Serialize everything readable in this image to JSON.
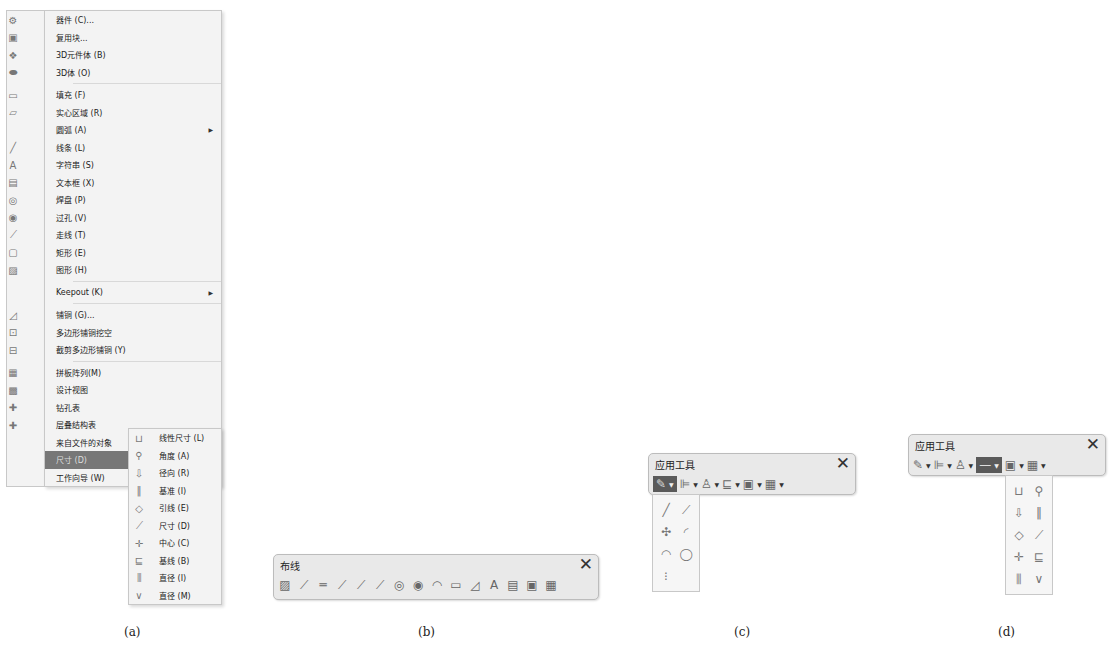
{
  "panel_a": {
    "main_menu": [
      {
        "icon": "component-icon",
        "glyph": "⚙",
        "label": "器件 (C)...",
        "submenu": false
      },
      {
        "icon": "reuse-block-icon",
        "glyph": "▣",
        "label": "复用块...",
        "submenu": false
      },
      {
        "icon": "3d-body-icon",
        "glyph": "❖",
        "label": "3D元件体 (B)",
        "submenu": false
      },
      {
        "icon": "3d-solid-icon",
        "glyph": "⬬",
        "label": "3D体 (O)",
        "submenu": false,
        "sep_after": true
      },
      {
        "icon": "fill-icon",
        "glyph": "▭",
        "label": "填充 (F)",
        "submenu": false
      },
      {
        "icon": "solid-region-icon",
        "glyph": "▱",
        "label": "实心区域 (R)",
        "submenu": false
      },
      {
        "icon": "",
        "glyph": "",
        "label": "圆弧 (A)",
        "submenu": true
      },
      {
        "icon": "line-icon",
        "glyph": "╱",
        "label": "线条 (L)",
        "submenu": false
      },
      {
        "icon": "string-icon",
        "glyph": "A",
        "label": "字符串 (S)",
        "submenu": false
      },
      {
        "icon": "text-frame-icon",
        "glyph": "▤",
        "label": "文本框 (X)",
        "submenu": false
      },
      {
        "icon": "pad-icon",
        "glyph": "◎",
        "label": "焊盘 (P)",
        "submenu": false
      },
      {
        "icon": "via-icon",
        "glyph": "◉",
        "label": "过孔 (V)",
        "submenu": false
      },
      {
        "icon": "track-icon",
        "glyph": "⟋",
        "label": "走线 (T)",
        "submenu": false
      },
      {
        "icon": "rectangle-icon",
        "glyph": "▢",
        "label": "矩形 (E)",
        "submenu": false
      },
      {
        "icon": "graphic-icon",
        "glyph": "▨",
        "label": "图形 (H)",
        "submenu": false,
        "sep_after": true
      },
      {
        "icon": "",
        "glyph": "",
        "label": "Keepout (K)",
        "submenu": true,
        "sep_after": true
      },
      {
        "icon": "polygon-pour-icon",
        "glyph": "◿",
        "label": "铺铜 (G)...",
        "submenu": false
      },
      {
        "icon": "polygon-cutout-icon",
        "glyph": "⊡",
        "label": "多边形铺铜挖空",
        "submenu": false
      },
      {
        "icon": "slice-polygon-icon",
        "glyph": "⊟",
        "label": "截剪多边形铺铜 (Y)",
        "submenu": false,
        "sep_after": true
      },
      {
        "icon": "panel-array-icon",
        "glyph": "▦",
        "label": "拼板阵列(M)",
        "submenu": false
      },
      {
        "icon": "design-view-icon",
        "glyph": "▩",
        "label": "设计视图",
        "submenu": false
      },
      {
        "icon": "drill-table-icon",
        "glyph": "✚",
        "label": "钻孔表",
        "submenu": false
      },
      {
        "icon": "layer-stack-table-icon",
        "glyph": "✚",
        "label": "层叠结构表",
        "submenu": false
      },
      {
        "icon": "",
        "glyph": "",
        "label": "来自文件的对象",
        "submenu": false
      },
      {
        "icon": "",
        "glyph": "",
        "label": "尺寸 (D)",
        "submenu": true,
        "active": true
      },
      {
        "icon": "",
        "glyph": "",
        "label": "工作向导 (W)",
        "submenu": true
      }
    ],
    "dimension_submenu": [
      {
        "icon": "linear-dimension-icon",
        "glyph": "⊔",
        "label": "线性尺寸 (L)"
      },
      {
        "icon": "angular-dimension-icon",
        "glyph": "⚲",
        "label": "角度 (A)"
      },
      {
        "icon": "radial-dimension-icon",
        "glyph": "⇩",
        "label": "径向 (R)"
      },
      {
        "icon": "datum-dimension-icon",
        "glyph": "‖",
        "label": "基准 (I)"
      },
      {
        "icon": "leader-dimension-icon",
        "glyph": "◇",
        "label": "引线 (E)"
      },
      {
        "icon": "standard-dimension-icon",
        "glyph": "⟋",
        "label": "尺寸 (D)"
      },
      {
        "icon": "center-dimension-icon",
        "glyph": "✛",
        "label": "中心 (C)"
      },
      {
        "icon": "baseline-dimension-icon",
        "glyph": "⊑",
        "label": "基线 (B)"
      },
      {
        "icon": "linear-diameter-icon",
        "glyph": "⫼",
        "label": "直径 (I)"
      },
      {
        "icon": "radial-diameter-icon",
        "glyph": "∨",
        "label": "直径 (M)"
      }
    ],
    "caption": "(a)"
  },
  "panel_b": {
    "title": "布线",
    "close_glyph": "✕",
    "buttons": [
      {
        "name": "route-multiple-icon",
        "glyph": "▨"
      },
      {
        "name": "interactive-route-icon",
        "glyph": "⟋"
      },
      {
        "name": "diff-pair-route-icon",
        "glyph": "═"
      },
      {
        "name": "multi-route-icon",
        "glyph": "⟋"
      },
      {
        "name": "tune-length-icon",
        "glyph": "⟋"
      },
      {
        "name": "tune-diff-pair-icon",
        "glyph": "⟋"
      },
      {
        "name": "pad-icon",
        "glyph": "◎"
      },
      {
        "name": "via-icon",
        "glyph": "◉"
      },
      {
        "name": "arc-icon",
        "glyph": "◠"
      },
      {
        "name": "fill-icon",
        "glyph": "▭"
      },
      {
        "name": "polygon-pour-icon",
        "glyph": "◿"
      },
      {
        "name": "string-icon",
        "glyph": "A"
      },
      {
        "name": "text-frame-icon",
        "glyph": "▤"
      },
      {
        "name": "component-icon",
        "glyph": "▣"
      },
      {
        "name": "reuse-block-icon",
        "glyph": "▦"
      }
    ],
    "caption": "(b)"
  },
  "panel_c": {
    "title": "应用工具",
    "close_glyph": "✕",
    "buttons": [
      {
        "name": "drawing-tools-icon",
        "glyph": "✎",
        "active": true
      },
      {
        "name": "align-icon",
        "glyph": "⊫"
      },
      {
        "name": "find-similar-icon",
        "glyph": "♙"
      },
      {
        "name": "dimension-icon",
        "glyph": "⊑"
      },
      {
        "name": "room-icon",
        "glyph": "▣"
      },
      {
        "name": "grid-icon",
        "glyph": "▦"
      }
    ],
    "dropdown": [
      {
        "name": "line-icon",
        "glyph": "╱"
      },
      {
        "name": "line-from-component-icon",
        "glyph": "⟋"
      },
      {
        "name": "set-origin-icon",
        "glyph": "✣"
      },
      {
        "name": "arc-center-icon",
        "glyph": "◜"
      },
      {
        "name": "arc-edge-icon",
        "glyph": "◠"
      },
      {
        "name": "full-circle-icon",
        "glyph": "◯"
      },
      {
        "name": "paste-array-icon",
        "glyph": "⁝"
      }
    ],
    "caption": "(c)"
  },
  "panel_d": {
    "title": "应用工具",
    "close_glyph": "✕",
    "buttons": [
      {
        "name": "drawing-tools-icon",
        "glyph": "✎"
      },
      {
        "name": "align-icon",
        "glyph": "⊫"
      },
      {
        "name": "find-similar-icon",
        "glyph": "♙"
      },
      {
        "name": "dimension-icon",
        "glyph": "—",
        "active": true
      },
      {
        "name": "room-icon",
        "glyph": "▣"
      },
      {
        "name": "grid-icon",
        "glyph": "▦"
      }
    ],
    "dropdown": [
      {
        "name": "linear-dimension-icon",
        "glyph": "⊔"
      },
      {
        "name": "angular-dimension-icon",
        "glyph": "⚲"
      },
      {
        "name": "radial-dimension-icon",
        "glyph": "⇩"
      },
      {
        "name": "datum-dimension-icon",
        "glyph": "‖"
      },
      {
        "name": "leader-dimension-icon",
        "glyph": "◇"
      },
      {
        "name": "standard-dimension-icon",
        "glyph": "⟋"
      },
      {
        "name": "center-dimension-icon",
        "glyph": "✛"
      },
      {
        "name": "baseline-dimension-icon",
        "glyph": "⊑"
      },
      {
        "name": "linear-diameter-icon",
        "glyph": "⫼"
      },
      {
        "name": "radial-diameter-icon",
        "glyph": "∨"
      }
    ],
    "caption": "(d)"
  },
  "colors": {
    "menu_bg": "#f3f3f3",
    "active_bg": "#777777",
    "toolbar_bg": "#e9e9e9"
  }
}
